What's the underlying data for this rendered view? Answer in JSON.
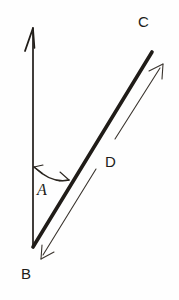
{
  "figure": {
    "background_color": "#fefefe",
    "ink_color": "#201c18",
    "thin_ink_color": "#3a342e",
    "width": 179,
    "height": 300
  },
  "labels": {
    "vertex_b": "B",
    "ray_c": "C",
    "angle_a": "A",
    "segment_d": "D"
  },
  "geometry": {
    "vertex": {
      "x": 33,
      "y": 247
    },
    "vertical_ray": {
      "name": "vertical-ray",
      "from": {
        "x": 33,
        "y": 247
      },
      "to": {
        "x": 33,
        "y": 30
      },
      "arrowhead": "at-top",
      "stroke_width": 1.6
    },
    "diagonal_ray": {
      "name": "diagonal-ray-bc",
      "from": {
        "x": 33,
        "y": 247
      },
      "to": {
        "x": 152,
        "y": 52
      },
      "arrowhead": "none",
      "stroke_width": 3.4
    },
    "angle_arc": {
      "name": "angle-arc-a",
      "start": {
        "x": 34,
        "y": 167
      },
      "end": {
        "x": 69,
        "y": 180
      },
      "double_headed": true,
      "stroke_width": 1.2
    },
    "parallel_measure": {
      "name": "parallel-measure-d",
      "from": {
        "x": 41,
        "y": 258
      },
      "to": {
        "x": 163,
        "y": 65
      },
      "double_headed": true,
      "stroke_width": 1.1,
      "gap_for_label": true
    }
  },
  "label_positions": {
    "vertex_b": {
      "x": 21,
      "y": 268
    },
    "ray_c": {
      "x": 138,
      "y": 18
    },
    "angle_a": {
      "x": 36,
      "y": 183
    },
    "segment_d": {
      "x": 105,
      "y": 155
    }
  }
}
